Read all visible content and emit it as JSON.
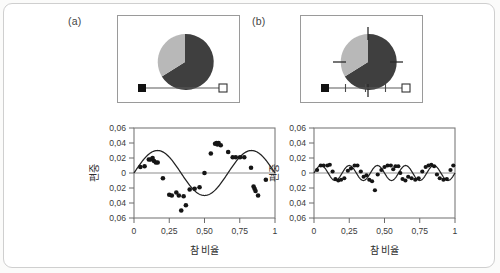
{
  "figure": {
    "background": "#ffffff",
    "border_color": "#cfcfcf"
  },
  "panels": [
    {
      "tag": "(a)",
      "widget": {
        "name": "pie-slider-widget",
        "pie": {
          "slices": [
            {
              "label": "dark-slice",
              "fraction": 0.65,
              "color": "#3f3f3f"
            },
            {
              "label": "light-slice",
              "fraction": 0.35,
              "color": "#b8b8b8"
            }
          ],
          "has_crosshair_ticks": false
        },
        "slider": {
          "handle_value": 0,
          "handle_filled": true,
          "end_marker_filled": false,
          "tick_count": 0,
          "track_color": "#5a5a5a"
        }
      },
      "chart_data": {
        "type": "scatter",
        "title": "",
        "xlabel": "참 비율",
        "ylabel": "편중",
        "xlim": [
          0,
          1
        ],
        "ylim": [
          -0.06,
          0.06
        ],
        "xticks": [
          0,
          0.25,
          0.5,
          0.75,
          1
        ],
        "xticklabels": [
          "0",
          "0,25",
          "0,50",
          "0,75",
          "1"
        ],
        "yticks": [
          -0.06,
          -0.04,
          -0.02,
          0,
          0.02,
          0.04,
          0.06
        ],
        "yticklabels": [
          "0,06",
          "0,04",
          "0,02",
          "0",
          "0,02",
          "0,04",
          "0,06"
        ],
        "grid": false,
        "zero_line": true,
        "points": [
          [
            0.045,
            0.008
          ],
          [
            0.075,
            0.009
          ],
          [
            0.105,
            0.018
          ],
          [
            0.118,
            0.018
          ],
          [
            0.132,
            0.02
          ],
          [
            0.142,
            0.016
          ],
          [
            0.155,
            0.014
          ],
          [
            0.168,
            0.014
          ],
          [
            0.205,
            -0.007
          ],
          [
            0.25,
            -0.029
          ],
          [
            0.268,
            -0.03
          ],
          [
            0.3,
            -0.026
          ],
          [
            0.318,
            -0.03
          ],
          [
            0.335,
            -0.05
          ],
          [
            0.352,
            -0.031
          ],
          [
            0.368,
            -0.043
          ],
          [
            0.395,
            -0.022
          ],
          [
            0.43,
            -0.021
          ],
          [
            0.465,
            -0.019
          ],
          [
            0.5,
            0.0
          ],
          [
            0.545,
            0.026
          ],
          [
            0.575,
            0.039
          ],
          [
            0.585,
            0.04
          ],
          [
            0.592,
            0.038
          ],
          [
            0.6,
            0.04
          ],
          [
            0.615,
            0.037
          ],
          [
            0.668,
            0.028
          ],
          [
            0.7,
            0.021
          ],
          [
            0.722,
            0.021
          ],
          [
            0.752,
            0.021
          ],
          [
            0.782,
            0.021
          ],
          [
            0.83,
            0.007
          ],
          [
            0.848,
            -0.018
          ],
          [
            0.855,
            -0.021
          ],
          [
            0.862,
            -0.024
          ],
          [
            0.88,
            -0.03
          ],
          [
            0.935,
            -0.009
          ]
        ],
        "series": [
          {
            "name": "fitted-sine",
            "type": "line",
            "amplitude": 0.03,
            "cycles": 1.5,
            "phase": 0
          }
        ]
      }
    },
    {
      "tag": "(b)",
      "widget": {
        "name": "pie-slider-widget",
        "pie": {
          "slices": [
            {
              "label": "dark-slice",
              "fraction": 0.65,
              "color": "#3f3f3f"
            },
            {
              "label": "light-slice",
              "fraction": 0.35,
              "color": "#b8b8b8"
            }
          ],
          "has_crosshair_ticks": true
        },
        "slider": {
          "handle_value": 0,
          "handle_filled": true,
          "end_marker_filled": false,
          "tick_count": 3,
          "track_color": "#5a5a5a"
        }
      },
      "chart_data": {
        "type": "scatter",
        "title": "",
        "xlabel": "참 비율",
        "ylabel": "편중",
        "xlim": [
          0,
          1
        ],
        "ylim": [
          -0.06,
          0.06
        ],
        "xticks": [
          0,
          0.25,
          0.5,
          0.75,
          1
        ],
        "xticklabels": [
          "0",
          "0,25",
          "0,50",
          "0,75",
          "1"
        ],
        "yticks": [
          -0.06,
          -0.04,
          -0.02,
          0,
          0.02,
          0.04,
          0.06
        ],
        "yticklabels": [
          "0,06",
          "0,04",
          "0,02",
          "0",
          "0,02",
          "0,04",
          "0,06"
        ],
        "grid": false,
        "zero_line": true,
        "points": [
          [
            0.022,
            0.004
          ],
          [
            0.048,
            0.01
          ],
          [
            0.068,
            0.01
          ],
          [
            0.095,
            0.01
          ],
          [
            0.112,
            0.011
          ],
          [
            0.132,
            0.002
          ],
          [
            0.152,
            -0.008
          ],
          [
            0.172,
            -0.01
          ],
          [
            0.192,
            -0.009
          ],
          [
            0.215,
            -0.007
          ],
          [
            0.24,
            0.003
          ],
          [
            0.262,
            0.006
          ],
          [
            0.288,
            0.01
          ],
          [
            0.308,
            0.01
          ],
          [
            0.332,
            0.002
          ],
          [
            0.352,
            -0.005
          ],
          [
            0.372,
            -0.003
          ],
          [
            0.392,
            -0.009
          ],
          [
            0.412,
            -0.011
          ],
          [
            0.432,
            -0.023
          ],
          [
            0.452,
            -0.002
          ],
          [
            0.478,
            0.004
          ],
          [
            0.5,
            0.008
          ],
          [
            0.522,
            0.01
          ],
          [
            0.545,
            0.01
          ],
          [
            0.562,
            0.005
          ],
          [
            0.578,
            0.009
          ],
          [
            0.598,
            0.009
          ],
          [
            0.612,
            0.0
          ],
          [
            0.628,
            -0.008
          ],
          [
            0.648,
            -0.01
          ],
          [
            0.668,
            -0.005
          ],
          [
            0.692,
            -0.007
          ],
          [
            0.718,
            -0.009
          ],
          [
            0.742,
            -0.007
          ],
          [
            0.768,
            0.002
          ],
          [
            0.792,
            0.008
          ],
          [
            0.812,
            0.01
          ],
          [
            0.832,
            0.011
          ],
          [
            0.852,
            0.009
          ],
          [
            0.872,
            -0.002
          ],
          [
            0.892,
            -0.007
          ],
          [
            0.918,
            -0.009
          ],
          [
            0.942,
            -0.008
          ],
          [
            0.968,
            0.004
          ],
          [
            0.988,
            0.01
          ]
        ],
        "series": [
          {
            "name": "fitted-sine",
            "type": "line",
            "amplitude": 0.01,
            "cycles": 5,
            "phase": 0
          }
        ]
      }
    }
  ]
}
